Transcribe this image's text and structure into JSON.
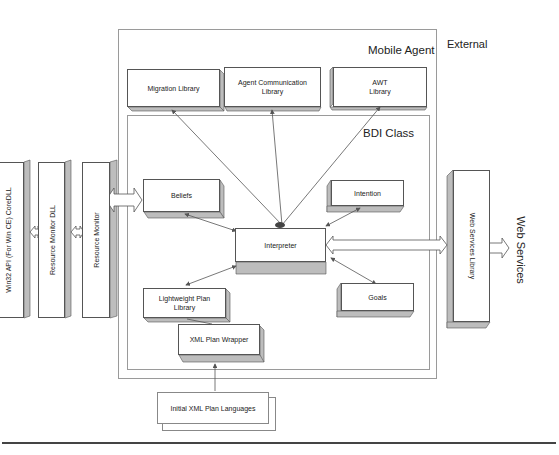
{
  "external_label": "External",
  "mobile_agent": {
    "label": "Mobile Agent",
    "libraries": [
      {
        "id": "migration",
        "label": "Migration Library"
      },
      {
        "id": "agent_comm",
        "label": "Agent Communication Library"
      },
      {
        "id": "awt",
        "label": "AWT Library"
      }
    ]
  },
  "bdi_class": {
    "label": "BDI Class",
    "components": {
      "beliefs": "Beliefs",
      "intention": "Intention",
      "interpreter": "Interpreter",
      "goals": "Goals",
      "lightweight_plan_library": "Lightweight Plan Library",
      "xml_plan_wrapper": "XML Plan Wrapper"
    }
  },
  "left_stack": [
    {
      "id": "win32",
      "label": "Win32 API (For Win CE) CoreDLL"
    },
    {
      "id": "resource_monitor_dll",
      "label": "Resource Monitor DLL"
    },
    {
      "id": "resource_monitor",
      "label": "Resource Monitor"
    }
  ],
  "web_services_library": "Web Services Library",
  "web_services": "Web Services",
  "initial_xml_plan_languages": "Initial XML Plan Languages",
  "colors": {
    "line": "#555555",
    "shade": "#bdbdbd",
    "frame": "#9a9a9a"
  }
}
